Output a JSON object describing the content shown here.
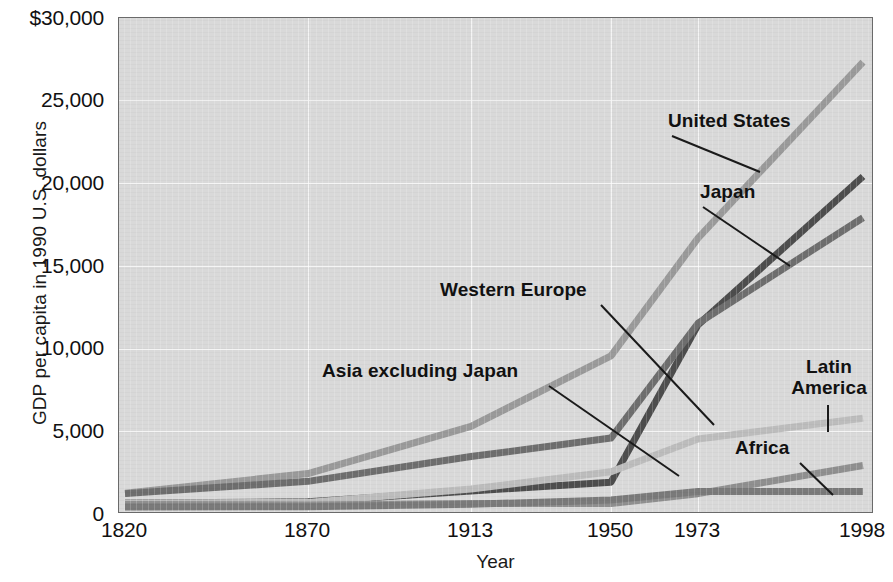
{
  "chart_data": {
    "type": "line",
    "title": "",
    "xlabel": "Year",
    "ylabel": "GDP per capita in 1990 U.S. dollars",
    "categories": [
      1820,
      1870,
      1913,
      1950,
      1973,
      1998
    ],
    "xtick_labels": [
      "1820",
      "1870",
      "1913",
      "1950",
      "1973",
      "1998"
    ],
    "ytick_labels": [
      "$30,000",
      "25,000",
      "20,000",
      "15,000",
      "10,000",
      "5,000",
      "0"
    ],
    "ytick_values": [
      30000,
      25000,
      20000,
      15000,
      10000,
      5000,
      0
    ],
    "ylim": [
      0,
      30000
    ],
    "grid": true,
    "legend_position": "inline-callouts",
    "series": [
      {
        "name": "United States",
        "color": "#9a9a9a",
        "values": [
          1257,
          2445,
          5301,
          9561,
          16689,
          27331
        ]
      },
      {
        "name": "Japan",
        "color": "#4d4d4d",
        "values": [
          669,
          737,
          1387,
          1926,
          11439,
          20413
        ]
      },
      {
        "name": "Western Europe",
        "color": "#6e6e6e",
        "values": [
          1232,
          1974,
          3473,
          4594,
          11534,
          17921
        ]
      },
      {
        "name": "Latin America",
        "color": "#bcbcbc",
        "values": [
          665,
          698,
          1511,
          2554,
          4531,
          5795
        ]
      },
      {
        "name": "Asia excluding Japan",
        "color": "#8f8f8f",
        "values": [
          575,
          543,
          640,
          635,
          1231,
          2936
        ]
      },
      {
        "name": "Africa",
        "color": "#7a7a7a",
        "values": [
          418,
          444,
          585,
          852,
          1365,
          1368
        ]
      }
    ]
  },
  "axis": {
    "x_title": "Year",
    "y_title": "GDP per capita in 1990 U.S. dollars"
  },
  "ylabels": {
    "t0": "$30,000",
    "t1": "25,000",
    "t2": "20,000",
    "t3": "15,000",
    "t4": "10,000",
    "t5": "5,000",
    "t6": "0"
  },
  "xlabels": {
    "t0": "1820",
    "t1": "1870",
    "t2": "1913",
    "t3": "1950",
    "t4": "1973",
    "t5": "1998"
  },
  "callouts": {
    "united_states": "United States",
    "japan": "Japan",
    "western_europe": "Western Europe",
    "asia_excluding_japan": "Asia excluding Japan",
    "latin_america_line1": "Latin",
    "latin_america_line2": "America",
    "africa": "Africa"
  }
}
